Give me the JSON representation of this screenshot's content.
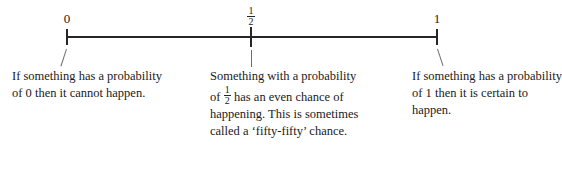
{
  "chart_data": {
    "type": "line",
    "xlabel": "",
    "ylabel": "",
    "xlim": [
      0,
      1
    ],
    "grid": false,
    "legend": "none",
    "axis": {
      "orientation": "horizontal",
      "line_color": "#262626",
      "start_value": 0,
      "end_value": 1
    },
    "ticks": [
      {
        "id": "zero",
        "label": "0",
        "value": 0,
        "position_fraction": 0
      },
      {
        "id": "half",
        "label": "1/2",
        "value": 0.5,
        "position_fraction": 0.5,
        "is_fraction": true,
        "numerator": "1",
        "denominator": "2"
      },
      {
        "id": "one",
        "label": "1",
        "value": 1,
        "position_fraction": 1
      }
    ],
    "annotations": [
      {
        "id": "zero-note",
        "anchor_value": 0,
        "leader": "diagonal-down-right",
        "text": "If something has a probability of 0 then it cannot happen."
      },
      {
        "id": "half-note",
        "anchor_value": 0.5,
        "leader": "vertical",
        "text": "Something with a probability of 1/2 has an even chance of happening. This is sometimes called a 'fifty-fifty' chance."
      },
      {
        "id": "one-note",
        "anchor_value": 1,
        "leader": "diagonal-down-left",
        "text": "If something has a probability of 1 then it is certain to happen."
      }
    ]
  },
  "labels": {
    "zero": "0",
    "one": "1",
    "half_numerator": "1",
    "half_denominator": "2"
  },
  "captions": {
    "left": "If something has a probability of 0 then it cannot happen.",
    "middle_part1": "Something with a probability of",
    "middle_fraction_numerator": "1",
    "middle_fraction_denominator": "2",
    "middle_part2": "has an even chance of happening. This is sometimes called a ‘fifty-fifty’ chance.",
    "right": "If something has a probability of 1 then it is certain to happen."
  },
  "colors": {
    "ink": "#1a1a1a",
    "axis": "#262626",
    "leader": "#6e6e6e",
    "background": "#ffffff"
  }
}
